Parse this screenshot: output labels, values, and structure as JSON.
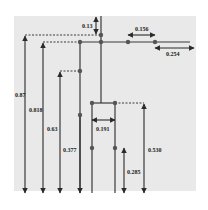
{
  "diagram": {
    "type": "dimensioned-tree-schematic",
    "colors": {
      "background": "#ffffff",
      "panel": "#e9e9e9",
      "line": "#3a3a3a",
      "node": "#555555"
    },
    "dimensions": [
      {
        "id": "d013",
        "label": "0.13",
        "orientation": "vertical"
      },
      {
        "id": "d0156",
        "label": "0.156",
        "orientation": "horizontal"
      },
      {
        "id": "d0254",
        "label": "0.254",
        "orientation": "horizontal"
      },
      {
        "id": "d087",
        "label": "0.87",
        "orientation": "vertical"
      },
      {
        "id": "d0818",
        "label": "0.818",
        "orientation": "vertical"
      },
      {
        "id": "d063",
        "label": "0.63",
        "orientation": "vertical"
      },
      {
        "id": "d0377",
        "label": "0.377",
        "orientation": "vertical"
      },
      {
        "id": "d0191",
        "label": "0.191",
        "orientation": "horizontal"
      },
      {
        "id": "d0530",
        "label": "0.530",
        "orientation": "vertical"
      },
      {
        "id": "d0285",
        "label": "0.285",
        "orientation": "vertical"
      }
    ]
  }
}
